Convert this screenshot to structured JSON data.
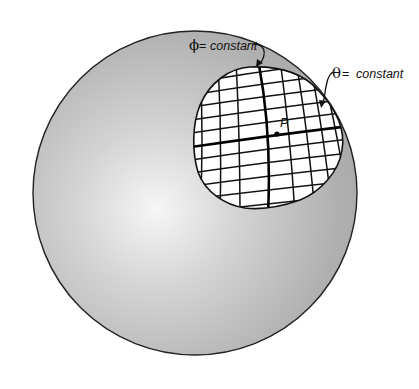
{
  "figure": {
    "width": 419,
    "height": 389,
    "background": "#ffffff"
  },
  "sphere": {
    "cx": 195,
    "cy": 193,
    "r": 162,
    "fill_light": "#f4f4f4",
    "fill_dark": "#a9a9a9",
    "stroke": "#222222"
  },
  "patch": {
    "fill": "#ffffff",
    "stroke": "#111111",
    "grid": "curvilinear coordinate mesh"
  },
  "point": {
    "label": "P",
    "x": 278,
    "y": 134
  },
  "labels": {
    "phi": {
      "symbol": "ϕ",
      "equals": " = ",
      "text": "constant"
    },
    "theta": {
      "symbol": "θ",
      "equals": " = ",
      "text": "constant"
    }
  }
}
